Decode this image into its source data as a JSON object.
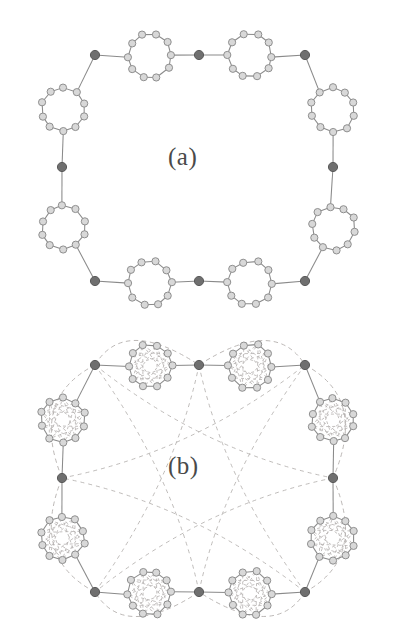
{
  "figure": {
    "kind": "molecular-ring-diagram",
    "width": 398,
    "height": 637,
    "background": "#ffffff"
  },
  "panels": [
    {
      "id": "a",
      "label": "(a)",
      "label_x": 168,
      "label_y": 143,
      "description": "Macrocycle of eight cluster rings joined by eight dark linker vertices, solid bonds only",
      "has_dashed_overlay": false
    },
    {
      "id": "b",
      "label": "(b)",
      "label_x": 168,
      "label_y": 452,
      "description": "Same macrocycle with additional dashed intra-cluster cross-links and dashed peripheral arcs",
      "has_dashed_overlay": true
    }
  ],
  "colors": {
    "background": "#ffffff",
    "bond_solid": "#8a8a8a",
    "bond_dashed": "#b4b0ae",
    "cluster_atom_fill": "#d8d8d8",
    "cluster_atom_stroke": "#8f8f8f",
    "linker_vertex_fill": "#6f6f6f",
    "linker_vertex_stroke": "#5a5a5a",
    "label_text": "#4a4a4a"
  },
  "geometry": {
    "cluster_atoms_per_ring": 10,
    "cluster_radius": 22,
    "cluster_atom_radius": 3.6,
    "linker_vertex_radius": 4.6,
    "rings_per_panel": 8,
    "linkers_per_panel": 8,
    "panel_a": {
      "center_x": 199,
      "center_y": 167,
      "macro_radius_x": 137,
      "macro_radius_y": 112
    },
    "panel_b": {
      "center_x": 199,
      "center_y": 478,
      "macro_radius_x": 137,
      "macro_radius_y": 108
    }
  },
  "chart_data": {
    "type": "scatter",
    "title": "",
    "xlabel": "",
    "ylabel": "",
    "panel_a_linker_vertices": [
      {
        "x": 95,
        "y": 55
      },
      {
        "x": 199,
        "y": 55
      },
      {
        "x": 305,
        "y": 55
      },
      {
        "x": 62,
        "y": 167
      },
      {
        "x": 333,
        "y": 167
      },
      {
        "x": 95,
        "y": 281
      },
      {
        "x": 199,
        "y": 281
      },
      {
        "x": 305,
        "y": 281
      }
    ],
    "panel_a_cluster_centers": [
      {
        "x": 150,
        "y": 56
      },
      {
        "x": 250,
        "y": 56
      },
      {
        "x": 63,
        "y": 110
      },
      {
        "x": 333,
        "y": 110
      },
      {
        "x": 63,
        "y": 228
      },
      {
        "x": 333,
        "y": 228
      },
      {
        "x": 150,
        "y": 283
      },
      {
        "x": 250,
        "y": 283
      }
    ],
    "panel_b_linker_vertices": [
      {
        "x": 95,
        "y": 365
      },
      {
        "x": 199,
        "y": 365
      },
      {
        "x": 305,
        "y": 365
      },
      {
        "x": 62,
        "y": 478
      },
      {
        "x": 333,
        "y": 478
      },
      {
        "x": 95,
        "y": 592
      },
      {
        "x": 199,
        "y": 592
      },
      {
        "x": 305,
        "y": 592
      }
    ],
    "panel_b_cluster_centers": [
      {
        "x": 150,
        "y": 366
      },
      {
        "x": 250,
        "y": 366
      },
      {
        "x": 63,
        "y": 420
      },
      {
        "x": 333,
        "y": 420
      },
      {
        "x": 63,
        "y": 538
      },
      {
        "x": 333,
        "y": 538
      },
      {
        "x": 150,
        "y": 593
      },
      {
        "x": 250,
        "y": 593
      }
    ]
  }
}
